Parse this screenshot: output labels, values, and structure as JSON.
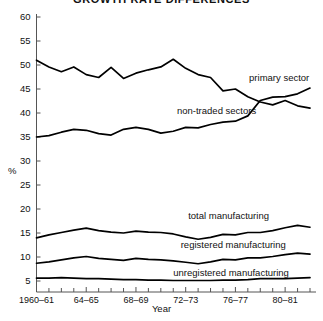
{
  "chart_data": {
    "type": "line",
    "title": "GROWTH RATE DIFFERENCES",
    "xlabel": "Year",
    "ylabel": "%",
    "ylim": [
      5,
      60
    ],
    "yticks": [
      5,
      10,
      15,
      20,
      25,
      30,
      35,
      40,
      45,
      50,
      55,
      60
    ],
    "xlim": [
      1960,
      1982
    ],
    "x": [
      1960,
      1961,
      1962,
      1963,
      1964,
      1965,
      1966,
      1967,
      1968,
      1969,
      1970,
      1971,
      1972,
      1973,
      1974,
      1975,
      1976,
      1977,
      1978,
      1979,
      1980,
      1981,
      1982
    ],
    "xtick_labels": [
      "1960–61",
      "64–65",
      "68–69",
      "72–73",
      "76–77",
      "80–81"
    ],
    "xtick_label_years": [
      1960,
      1964,
      1968,
      1972,
      1976,
      1980
    ],
    "grid": false,
    "legend_position": "inline-annotations",
    "series": [
      {
        "name": "primary sector",
        "label": "primary sector",
        "label_x": 1977.1,
        "label_y": 47.2,
        "values": [
          51.0,
          49.6,
          48.6,
          49.6,
          48.0,
          47.4,
          49.5,
          47.2,
          48.3,
          49.0,
          49.6,
          51.2,
          49.3,
          48.0,
          47.4,
          44.6,
          45.0,
          43.4,
          42.3,
          41.7,
          42.6,
          41.5,
          41.0
        ]
      },
      {
        "name": "non-traded sectors",
        "label": "non-traded sectors",
        "label_x": 1971.3,
        "label_y": 40.4,
        "values": [
          35.0,
          35.3,
          36.0,
          36.6,
          36.4,
          35.7,
          35.4,
          36.6,
          37.0,
          36.6,
          35.8,
          36.2,
          37.0,
          36.9,
          37.6,
          38.1,
          38.3,
          39.4,
          42.6,
          43.3,
          43.4,
          44.0,
          45.2
        ]
      },
      {
        "name": "total manufacturing",
        "label": "total manufacturing",
        "label_x": 1972.2,
        "label_y": 18.6,
        "values": [
          14.0,
          14.6,
          15.1,
          15.6,
          16.0,
          15.5,
          15.2,
          15.0,
          15.4,
          15.2,
          15.1,
          14.8,
          14.2,
          13.7,
          14.1,
          14.7,
          14.6,
          15.1,
          15.1,
          15.5,
          16.1,
          16.6,
          16.2
        ]
      },
      {
        "name": "registered manufacturing",
        "label": "registered manufacturing",
        "label_x": 1971.6,
        "label_y": 12.6,
        "values": [
          8.7,
          9.0,
          9.4,
          9.8,
          10.1,
          9.7,
          9.5,
          9.3,
          9.7,
          9.5,
          9.4,
          9.2,
          8.9,
          8.6,
          9.0,
          9.5,
          9.4,
          9.8,
          9.8,
          10.1,
          10.5,
          10.8,
          10.6
        ]
      },
      {
        "name": "unregistered manufacturing",
        "label": "unregistered manufacturing",
        "label_x": 1971.0,
        "label_y": 6.6,
        "values": [
          5.6,
          5.6,
          5.7,
          5.6,
          5.5,
          5.5,
          5.4,
          5.3,
          5.3,
          5.2,
          5.2,
          5.1,
          5.1,
          5.1,
          5.1,
          5.2,
          5.2,
          5.3,
          5.5,
          5.5,
          5.5,
          5.6,
          5.7
        ]
      }
    ]
  }
}
